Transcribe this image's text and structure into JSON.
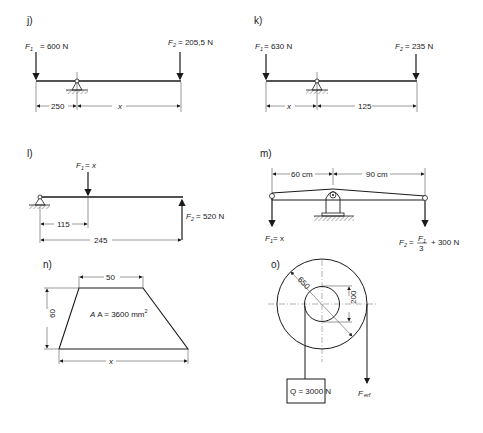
{
  "problems": {
    "j": {
      "label": "j)",
      "f1": "600 N",
      "f2": "205,5 N",
      "dim_left": "250",
      "dim_right": "x"
    },
    "k": {
      "label": "k)",
      "f1": "630 N",
      "f2": "235 N",
      "dim_left": "x",
      "dim_right": "125"
    },
    "l": {
      "label": "l)",
      "f1": "x",
      "f2": "520 N",
      "dim_short": "115",
      "dim_long": "245"
    },
    "m": {
      "label": "m)",
      "dim_left": "60 cm",
      "dim_right": "90 cm",
      "f1": "x",
      "f2_prefix": "=",
      "f2_num": "F",
      "f2_den": "3",
      "f2_suffix": "+ 300 N"
    },
    "n": {
      "label": "n)",
      "top": "50",
      "height": "60",
      "area_prefix": "A = 3600 mm",
      "area_exp": "2",
      "bottom": "x"
    },
    "o": {
      "label": "o)",
      "outer_diameter": "650",
      "inner_diameter": "200",
      "load": "Q = 3000 N",
      "force": "F",
      "force_sub": "erf"
    }
  },
  "symbols": {
    "force": "F",
    "sub1": "1",
    "sub2": "2",
    "eq": "="
  }
}
